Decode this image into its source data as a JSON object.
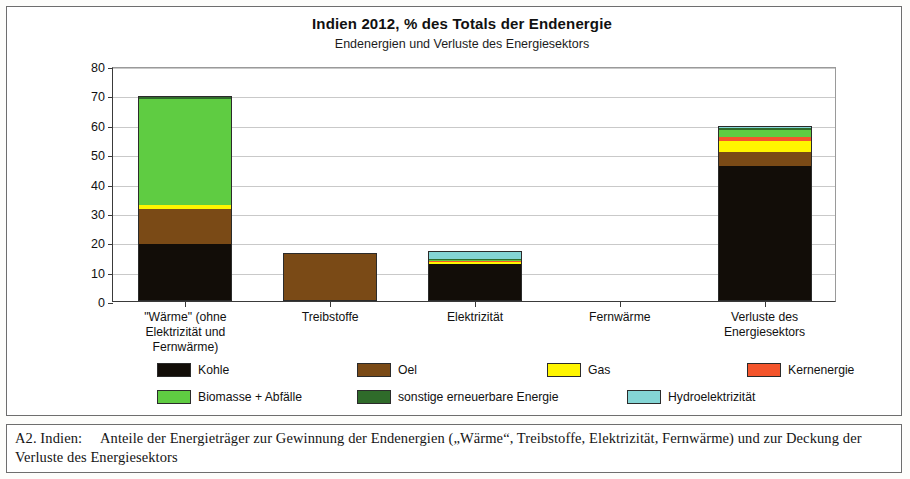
{
  "chart_data": {
    "type": "bar",
    "stacked": true,
    "title": "Indien  2012, % des Totals der Endenergie",
    "subtitle": "Endenergien und Verluste des Energiesektors",
    "ylabel": "100% = 476 Mtoe",
    "xlabel": "",
    "ylim": [
      0,
      80
    ],
    "yticks": [
      0,
      10,
      20,
      30,
      40,
      50,
      60,
      70,
      80
    ],
    "grid": true,
    "legend_position": "bottom",
    "categories": [
      "\"Wärme\" (ohne Elektrizität und Fernwärme)",
      "Treibstoffe",
      "Elektrizität",
      "Fernwärme",
      "Verluste des Energiesektors"
    ],
    "category_lines": [
      [
        "\"Wärme\" (ohne",
        "Elektrizität und",
        "Fernwärme)"
      ],
      [
        "Treibstoffe"
      ],
      [
        "Elektrizität"
      ],
      [
        "Fernwärme"
      ],
      [
        "Verluste des",
        "Energiesektors"
      ]
    ],
    "series": [
      {
        "name": "Kohle",
        "color": "#120d08",
        "values": [
          19.0,
          0.0,
          12.4,
          0.0,
          45.5
        ]
      },
      {
        "name": "Oel",
        "color": "#7a4a16",
        "values": [
          12.0,
          15.7,
          0.0,
          0.0,
          5.0
        ]
      },
      {
        "name": "Gas",
        "color": "#fff500",
        "values": [
          1.4,
          0.0,
          0.7,
          0.0,
          3.6
        ]
      },
      {
        "name": "Kernenergie",
        "color": "#f4552c",
        "values": [
          0.0,
          0.0,
          0.2,
          0.0,
          1.3
        ]
      },
      {
        "name": "Biomasse + Abfälle",
        "color": "#5fcc42",
        "values": [
          36.2,
          0.0,
          0.15,
          0.0,
          2.5
        ]
      },
      {
        "name": "sonstige erneuerbare Energie",
        "color": "#2f6b2a",
        "values": [
          0.5,
          0.0,
          0.45,
          0.0,
          0.6
        ]
      },
      {
        "name": "Hydroelektrizität",
        "color": "#84d5d5",
        "values": [
          0.0,
          0.0,
          2.4,
          0.0,
          0.5
        ]
      }
    ],
    "totals": [
      69.1,
      15.7,
      16.3,
      0.0,
      59.0
    ]
  },
  "caption": {
    "prefix": "A2.  Indien:",
    "text": "Anteile der Energieträger zur Gewinnung der Endenergien („Wärme“, Treibstoffe, Elektrizität, Fernwärme) und zur Deckung der Verluste des Energiesektors"
  }
}
